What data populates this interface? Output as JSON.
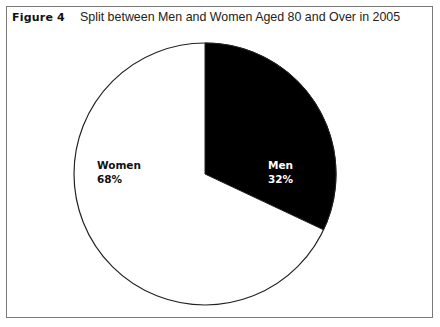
{
  "figure": {
    "label": "Figure 4",
    "title": "Split between Men and Women Aged 80 and Over in 2005"
  },
  "labels": {
    "women_name": "Women",
    "women_pct": "68%",
    "men_name": "Men",
    "men_pct": "32%"
  },
  "colors": {
    "men": "#000000",
    "women": "#ffffff",
    "outline": "#222222"
  },
  "chart_data": {
    "type": "pie",
    "title": "Split between Men and Women Aged 80 and Over in 2005",
    "categories": [
      "Men",
      "Women"
    ],
    "values": [
      32,
      68
    ],
    "unit": "%",
    "start_angle": "12 o'clock, clockwise",
    "legend": "none (inline labels)"
  }
}
